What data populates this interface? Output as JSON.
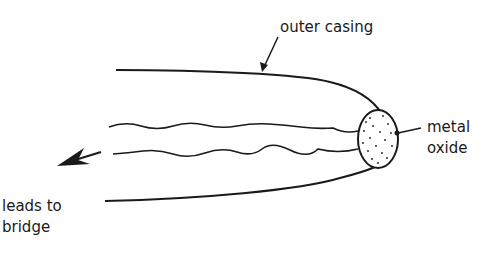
{
  "diagram": {
    "type": "labeled-schematic",
    "labels": {
      "outer_casing": "outer casing",
      "metal_oxide_line1": "metal",
      "metal_oxide_line2": "oxide",
      "leads_line1": "leads to",
      "leads_line2": "bridge"
    },
    "colors": {
      "stroke": "#1a1a1a",
      "background": "#ffffff"
    }
  }
}
